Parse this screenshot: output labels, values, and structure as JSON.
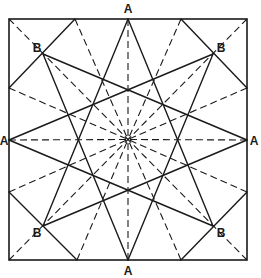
{
  "diagram": {
    "colors": {
      "ink": "#1a1a1a",
      "background": "#ffffff"
    },
    "frame": {
      "x": 9,
      "y": 19,
      "width": 238,
      "height": 241
    },
    "center": {
      "x": 128,
      "y": 139.5
    },
    "points": {
      "A_top": [
        128,
        19
      ],
      "A_bottom": [
        128,
        260
      ],
      "A_left": [
        9,
        140
      ],
      "A_right": [
        247,
        140
      ],
      "B_tl": [
        43,
        54
      ],
      "B_tr": [
        213,
        54
      ],
      "B_bl": [
        43,
        226
      ],
      "B_br": [
        213,
        226
      ],
      "E_top_l": [
        75,
        19
      ],
      "E_top_r": [
        181,
        19
      ],
      "E_right_t": [
        247,
        88
      ],
      "E_right_b": [
        247,
        192
      ],
      "E_bottom_r": [
        181,
        260
      ],
      "E_bottom_l": [
        77,
        260
      ],
      "E_left_b": [
        9,
        192
      ],
      "E_left_t": [
        9,
        88
      ],
      "C_tl": [
        9,
        19
      ],
      "C_tr": [
        247,
        19
      ],
      "C_br": [
        247,
        260
      ],
      "C_bl": [
        9,
        260
      ]
    },
    "solid_lines": [
      [
        "A_top",
        "B_bl"
      ],
      [
        "A_top",
        "B_br"
      ],
      [
        "A_bottom",
        "B_tl"
      ],
      [
        "A_bottom",
        "B_tr"
      ],
      [
        "A_left",
        "B_tr"
      ],
      [
        "A_left",
        "B_br"
      ],
      [
        "A_right",
        "B_tl"
      ],
      [
        "A_right",
        "B_bl"
      ],
      [
        "E_top_l",
        "E_left_t"
      ],
      [
        "E_top_r",
        "E_right_t"
      ],
      [
        "E_right_b",
        "E_bottom_r"
      ],
      [
        "E_bottom_l",
        "E_left_b"
      ]
    ],
    "dashed_rays_to_center": [
      "A_top",
      "A_bottom",
      "A_left",
      "A_right",
      "C_tl",
      "C_tr",
      "C_br",
      "C_bl",
      "E_top_l",
      "E_top_r",
      "E_right_t",
      "E_right_b",
      "E_bottom_r",
      "E_bottom_l",
      "E_left_b",
      "E_left_t"
    ],
    "labels": [
      {
        "text": "A",
        "x": 128,
        "y": 13,
        "anchor": "middle"
      },
      {
        "text": "A",
        "x": 128,
        "y": 275,
        "anchor": "middle"
      },
      {
        "text": "A",
        "x": 4,
        "y": 145,
        "anchor": "middle"
      },
      {
        "text": "A",
        "x": 254,
        "y": 145,
        "anchor": "middle"
      },
      {
        "text": "B",
        "x": 37,
        "y": 52,
        "anchor": "middle"
      },
      {
        "text": "B",
        "x": 221,
        "y": 52,
        "anchor": "middle"
      },
      {
        "text": "B",
        "x": 37,
        "y": 237,
        "anchor": "middle"
      },
      {
        "text": "B",
        "x": 221,
        "y": 237,
        "anchor": "middle"
      }
    ]
  }
}
